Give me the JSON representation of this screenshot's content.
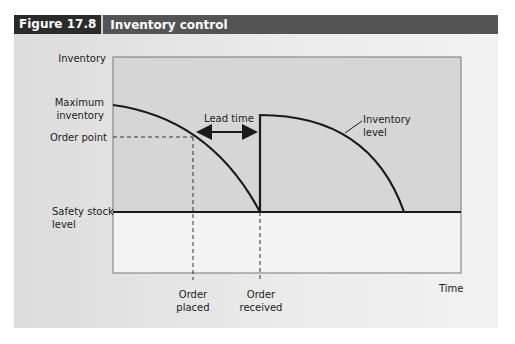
{
  "figure": {
    "number": "Figure 17.8",
    "title": "Inventory control"
  },
  "labels": {
    "y_axis": "Inventory",
    "max_inventory": [
      "Maximum",
      "inventory"
    ],
    "order_point": "Order point",
    "safety_stock": [
      "Safety stock",
      "level"
    ],
    "lead_time": "Lead time",
    "inventory_level": [
      "Inventory",
      "level"
    ],
    "order_placed": [
      "Order",
      "placed"
    ],
    "order_received": [
      "Order",
      "received"
    ],
    "x_axis": "Time"
  },
  "colors": {
    "header_bg": "#545454",
    "figure_num_bg": "#2b2b2b",
    "plot_upper": "#d6d6d6",
    "plot_lower": "#f4f4f4",
    "line": "#1a1a1a"
  }
}
